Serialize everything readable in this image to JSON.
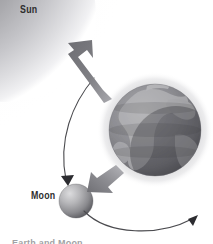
{
  "figure": {
    "background_color": "#ffffff",
    "width": 213,
    "height": 244
  },
  "labels": {
    "sun": "Sun",
    "moon": "Moon",
    "caption_partial": "Earth and Moon"
  },
  "bodies": {
    "sun": {
      "name": "Sun",
      "center_x": 8,
      "center_y": 14,
      "radius": 86,
      "core_color": "#808085",
      "edge_color": "#c9c9cd",
      "glow_color": "#e6e6e9"
    },
    "earth": {
      "name": "Earth",
      "center_x": 155,
      "center_y": 130,
      "radius": 46,
      "halo_radius": 57,
      "ocean_color": "#8b8b90",
      "land_color": "#b4b4b6",
      "shadow_color": "#5a5a5f",
      "halo_color": "#dcdcdd"
    },
    "moon": {
      "name": "Moon",
      "center_x": 76,
      "center_y": 201,
      "radius": 17,
      "light_color": "#d2d2d4",
      "mid_color": "#9a9a9d",
      "shadow_color": "#4d4d51"
    }
  },
  "arrows": {
    "sunward": {
      "name": "moon-to-sun-arrow",
      "description": "Thick gray arrow from Earth region pointing up-left toward the Sun",
      "color": "#7c7c80",
      "tip_x": 69,
      "tip_y": 44,
      "tail_x": 112,
      "tail_y": 96
    },
    "earth_to_moon": {
      "name": "earth-to-moon-arrow",
      "description": "Short thick gray arrow from Earth pointing down-left toward the Moon",
      "color": "#8a8a8e",
      "tip_x": 86,
      "tip_y": 187,
      "tail_x": 114,
      "tail_y": 166
    },
    "orbit_upper": {
      "name": "moon-orbit-upper-arc",
      "description": "Thin curved arc sweeping from upper right down to an arrowhead at the Moon",
      "color": "#4b4b4f",
      "tip_x": 68,
      "tip_y": 184,
      "tail_x": 94,
      "tail_y": 78
    },
    "orbit_lower": {
      "name": "moon-orbit-lower-arc",
      "description": "Thin curved arc sweeping from the Moon rightward to an arrowhead at lower right",
      "color": "#4b4b4f",
      "tip_x": 196,
      "tip_y": 216,
      "tail_x": 86,
      "tail_y": 212
    }
  }
}
